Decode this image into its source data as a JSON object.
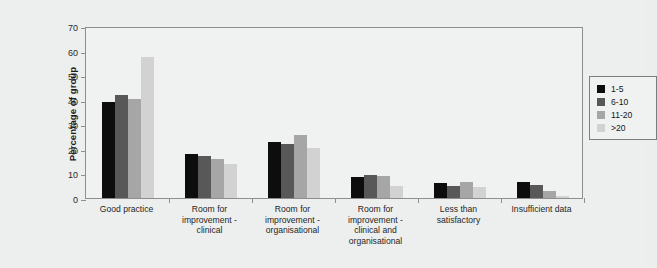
{
  "chart_data": {
    "type": "bar",
    "title": "",
    "xlabel": "",
    "ylabel": "Percentage of group",
    "ylim": [
      0,
      70
    ],
    "ytick_step": 10,
    "yticks": [
      70,
      60,
      50,
      40,
      30,
      20,
      10,
      0
    ],
    "grid": false,
    "legend_position": "top-right",
    "categories": [
      "Good practice",
      "Room for\nimprovement -\nclinical",
      "Room for\nimprovement -\norganisational",
      "Room for\nimprovement -\nclinical and\norganisational",
      "Less than\nsatisfactory",
      "Insufficient data"
    ],
    "series": [
      {
        "name": "1-5",
        "color": "#0d0d0d",
        "values": [
          39.0,
          18.0,
          23.0,
          8.5,
          6.0,
          6.5
        ]
      },
      {
        "name": "6-10",
        "color": "#585858",
        "values": [
          42.0,
          17.3,
          22.0,
          9.5,
          5.0,
          5.5
        ]
      },
      {
        "name": "11-20",
        "color": "#a6a6a6",
        "values": [
          40.5,
          16.0,
          25.5,
          9.0,
          6.5,
          3.0
        ]
      },
      {
        "name": ">20",
        "color": "#d2d2d2",
        "values": [
          57.5,
          14.0,
          20.5,
          5.0,
          4.5,
          1.0
        ]
      }
    ]
  },
  "colors": {
    "background": "#edefee",
    "plot_background": "#f0f2f1",
    "axis": "#8e8e8e",
    "text": "#1f1f1f"
  }
}
